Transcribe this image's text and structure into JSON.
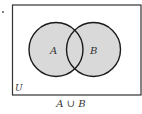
{
  "diagram": {
    "type": "venn",
    "universe_label": "U",
    "sets": [
      {
        "label": "A",
        "cx": 56,
        "cy": 49.5,
        "r": 27
      },
      {
        "label": "B",
        "cx": 93.5,
        "cy": 49.5,
        "r": 27
      }
    ],
    "shaded_region": "A ∪ B",
    "caption": "A ∪ B",
    "colors": {
      "fill": "#d9d9d9",
      "stroke": "#1a1a1a",
      "frame": "#333333",
      "background": "#ffffff"
    }
  }
}
